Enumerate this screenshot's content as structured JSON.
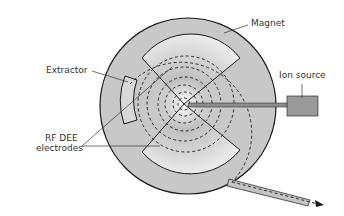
{
  "labels": {
    "magnet": "Magnet",
    "extractor": "Extractor",
    "ion_source": "Ion source",
    "rf_dee_line1": "RF DEE",
    "rf_dee_line2": "electrodes"
  },
  "colors": {
    "magnet_fill": "#c8c8c8",
    "dee_light": "#f2f2f2",
    "dee_dark": "#bdbdbd",
    "outline": "#1a1a1a",
    "ion_source_fill": "#9a9a9a",
    "beam_tube": "#c4c4c4"
  }
}
